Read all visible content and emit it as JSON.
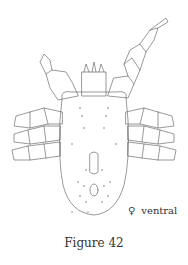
{
  "figure": {
    "caption": "Figure 42",
    "sex_symbol": "♀",
    "view_label": "ventral",
    "line_color": "#555555"
  }
}
